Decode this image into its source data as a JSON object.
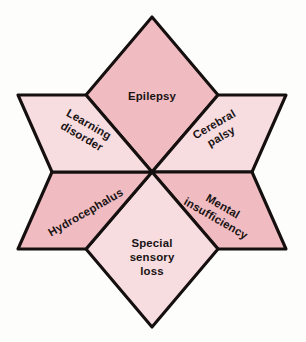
{
  "diagram": {
    "type": "hexagram-segments",
    "center": {
      "x": 152,
      "y": 172
    },
    "colors": {
      "fill_dark": "#F0BCC2",
      "fill_light": "#F7DCE0",
      "outline": "#15100F",
      "text": "#191313",
      "background": "#FDFDFC"
    },
    "segments": [
      {
        "id": "epilepsy",
        "label": "Epilepsy",
        "position": "top",
        "shade": "dark",
        "fill": "#F0BCC2",
        "rotation_deg": 0,
        "label_x": 152,
        "label_y": 97
      },
      {
        "id": "cerebral-palsy",
        "label": "Cerebral\npalsy",
        "position": "upper-right",
        "shade": "light",
        "fill": "#F7DCE0",
        "rotation_deg": -30,
        "label_x": 218,
        "label_y": 131
      },
      {
        "id": "mental-insufficiency",
        "label": "Mental\ninsufficiency",
        "position": "lower-right",
        "shade": "dark",
        "fill": "#F0BCC2",
        "rotation_deg": 30,
        "label_x": 219,
        "label_y": 213
      },
      {
        "id": "special-sensory-loss",
        "label": "Special\nsensory\nloss",
        "position": "bottom",
        "shade": "light",
        "fill": "#F7DCE0",
        "rotation_deg": 0,
        "label_x": 152,
        "label_y": 258
      },
      {
        "id": "hydrocephalus",
        "label": "Hydrocephalus",
        "position": "lower-left",
        "shade": "dark",
        "fill": "#F0BCC2",
        "rotation_deg": -30,
        "label_x": 86,
        "label_y": 213
      },
      {
        "id": "learning-disorder",
        "label": "Learning\ndisorder",
        "position": "upper-left",
        "shade": "light",
        "fill": "#F7DCE0",
        "rotation_deg": 30,
        "label_x": 85,
        "label_y": 131
      }
    ]
  }
}
